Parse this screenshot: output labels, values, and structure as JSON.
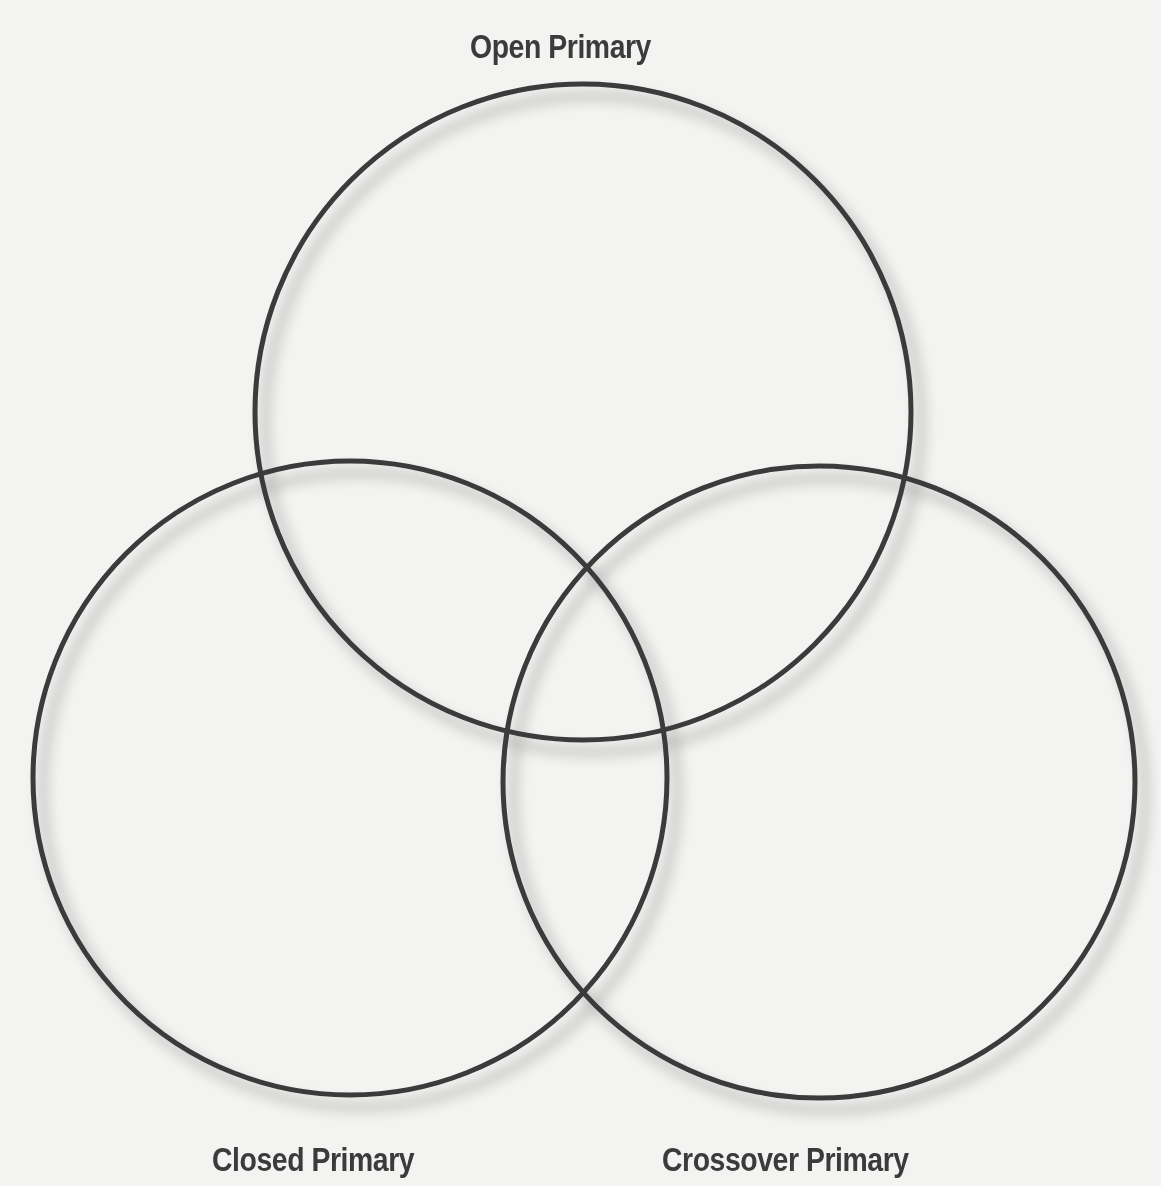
{
  "diagram": {
    "type": "venn",
    "sets": [
      {
        "id": "open",
        "label": "Open Primary",
        "cx": 583,
        "cy": 412,
        "r": 328
      },
      {
        "id": "closed",
        "label": "Closed Primary",
        "cx": 350,
        "cy": 778,
        "r": 317
      },
      {
        "id": "crossover",
        "label": "Crossover Primary",
        "cx": 819,
        "cy": 782,
        "r": 316
      }
    ],
    "stroke_color": "#3a3a3a",
    "background": "#f3f3f2"
  },
  "labels": {
    "open": "Open Primary",
    "closed": "Closed Primary",
    "crossover": "Crossover Primary"
  }
}
